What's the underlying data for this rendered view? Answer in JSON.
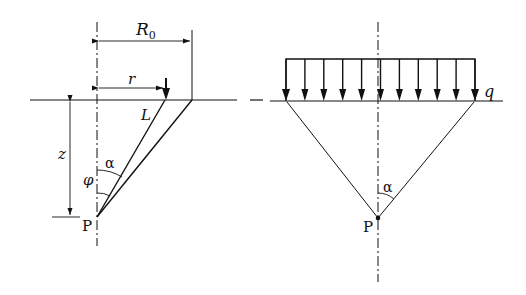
{
  "left_diagram": {
    "labels": {
      "R0_main": "R",
      "R0_sub": "0",
      "r": "r",
      "L": "L",
      "z": "z",
      "alpha": "α",
      "phi": "φ",
      "P": "P"
    }
  },
  "right_diagram": {
    "labels": {
      "q": "q",
      "alpha": "α",
      "P": "P"
    },
    "load_arrow_count": 11
  },
  "colors": {
    "stroke": "#111111",
    "background": "#ffffff"
  }
}
